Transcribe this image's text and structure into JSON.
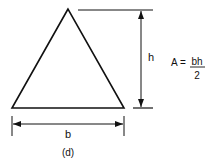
{
  "figure": {
    "label": "(d)",
    "shape": "triangle",
    "dimensions": {
      "base_label": "b",
      "height_label": "h"
    },
    "formula": {
      "lhs": "A =",
      "numerator": "bh",
      "denominator": "2"
    },
    "colors": {
      "stroke": "#111111",
      "background": "#ffffff"
    }
  }
}
